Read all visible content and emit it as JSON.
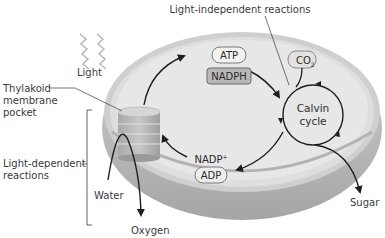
{
  "diagram": {
    "type": "chloroplast photosynthesis diagram",
    "labels": {
      "light_independent": "Light-independent reactions",
      "light": "Light",
      "thylakoid_line1": "Thylakoid",
      "thylakoid_line2": "membrane",
      "thylakoid_line3": "pocket",
      "light_dependent_line1": "Light-dependent",
      "light_dependent_line2": "reactions",
      "water": "Water",
      "oxygen": "Oxygen",
      "sugar": "Sugar",
      "calvin_line1": "Calvin",
      "calvin_line2": "cycle"
    },
    "molecules": {
      "atp": "ATP",
      "nadph": "NADPH",
      "co2": "CO",
      "co2_sub": "2",
      "nadp": "NADP",
      "nadp_sup": "+",
      "adp": "ADP"
    },
    "colors": {
      "stroma": "#e6e6e6",
      "outer_membrane": "#c9c9c9",
      "rim_shadow": "#a9a9a9",
      "thylakoid": "#bdbdbd",
      "arrow": "#1e1e1e",
      "nadph_fill": "#b8b8b8",
      "text": "#3a3a3a"
    }
  }
}
